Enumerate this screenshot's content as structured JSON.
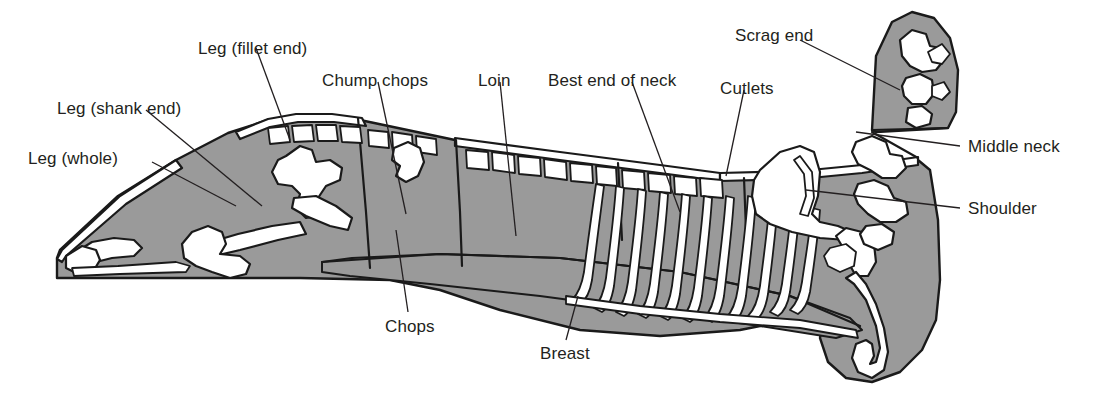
{
  "figure": {
    "colors": {
      "meat_fill": "#9a9a9a",
      "bone_fill": "#ffffff",
      "outline": "#1a1a1a",
      "background": "#ffffff",
      "label_text": "#231f20",
      "leader_line": "#231f20"
    }
  },
  "labels": [
    {
      "id": "leg-whole",
      "text": "Leg (whole)",
      "x": 28,
      "y": 150,
      "anchor": "left"
    },
    {
      "id": "leg-shank-end",
      "text": "Leg (shank end)",
      "x": 57,
      "y": 100,
      "anchor": "left"
    },
    {
      "id": "leg-fillet-end",
      "text": "Leg (fillet end)",
      "x": 198,
      "y": 40,
      "anchor": "left"
    },
    {
      "id": "chump-chops",
      "text": "Chump chops",
      "x": 322,
      "y": 72,
      "anchor": "left"
    },
    {
      "id": "loin",
      "text": "Loin",
      "x": 478,
      "y": 72,
      "anchor": "left"
    },
    {
      "id": "best-end-of-neck",
      "text": "Best end of neck",
      "x": 548,
      "y": 72,
      "anchor": "left"
    },
    {
      "id": "cutlets",
      "text": "Cutlets",
      "x": 720,
      "y": 80,
      "anchor": "left"
    },
    {
      "id": "scrag-end",
      "text": "Scrag end",
      "x": 735,
      "y": 27,
      "anchor": "left"
    },
    {
      "id": "middle-neck",
      "text": "Middle neck",
      "x": 968,
      "y": 138,
      "anchor": "left"
    },
    {
      "id": "shoulder",
      "text": "Shoulder",
      "x": 968,
      "y": 200,
      "anchor": "left"
    },
    {
      "id": "chops",
      "text": "Chops",
      "x": 385,
      "y": 318,
      "anchor": "left"
    },
    {
      "id": "breast",
      "text": "Breast",
      "x": 540,
      "y": 345,
      "anchor": "left"
    }
  ],
  "cut_sections": [
    {
      "id": "leg",
      "name": "Leg"
    },
    {
      "id": "chump",
      "name": "Chump"
    },
    {
      "id": "loin",
      "name": "Loin"
    },
    {
      "id": "best-end",
      "name": "Best end of neck"
    },
    {
      "id": "middle-neck",
      "name": "Middle neck"
    },
    {
      "id": "scrag-end",
      "name": "Scrag end"
    },
    {
      "id": "shoulder",
      "name": "Shoulder"
    },
    {
      "id": "breast",
      "name": "Breast"
    }
  ]
}
